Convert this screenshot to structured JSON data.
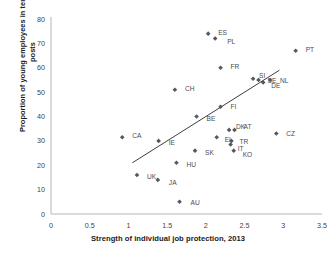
{
  "chart_data": {
    "type": "scatter",
    "title": "",
    "xlabel": "Strength of individual job protection, 2013",
    "ylabel": "Proportion of young employees in temporary posts",
    "xlim": [
      0,
      3.5
    ],
    "ylim": [
      0,
      80
    ],
    "xticks": [
      "0",
      "0.5",
      "1",
      "1.5",
      "2",
      "2.5",
      "3",
      "3.5"
    ],
    "yticks": [
      "0",
      "10",
      "20",
      "30",
      "40",
      "50",
      "60",
      "70",
      "80"
    ],
    "grid": false,
    "legend": "none",
    "marker_color": "#56565f",
    "trendline_color": "#3c3c44",
    "trendline": {
      "x0": 1.05,
      "y0": 21.0,
      "x1": 2.95,
      "y1": 59.0
    },
    "points": [
      {
        "label": "ES",
        "x": 2.03,
        "y": 74.0,
        "lx": 10,
        "ly": 1
      },
      {
        "label": "PL",
        "x": 2.12,
        "y": 72.0,
        "lx": 12,
        "ly": 5
      },
      {
        "label": "PT",
        "x": 3.16,
        "y": 67.0,
        "lx": 10,
        "ly": 1
      },
      {
        "label": "FR",
        "x": 2.19,
        "y": 60.0,
        "lx": 10,
        "ly": 1
      },
      {
        "label": "SI",
        "x": 2.61,
        "y": 55.5,
        "lx": 6,
        "ly": -1
      },
      {
        "label": "SE",
        "x": 2.68,
        "y": 55.0,
        "lx": 9,
        "ly": 0
      },
      {
        "label": "DE",
        "x": 2.74,
        "y": 54.0,
        "lx": 8,
        "ly": 6
      },
      {
        "label": "NL",
        "x": 2.83,
        "y": 55.0,
        "lx": 10,
        "ly": 0
      },
      {
        "label": "CH",
        "x": 1.6,
        "y": 51.0,
        "lx": 10,
        "ly": 1
      },
      {
        "label": "FI",
        "x": 2.19,
        "y": 44.0,
        "lx": 10,
        "ly": 2
      },
      {
        "label": "BE",
        "x": 1.88,
        "y": 40.0,
        "lx": 10,
        "ly": 4
      },
      {
        "label": "DK",
        "x": 2.3,
        "y": 34.5,
        "lx": 7,
        "ly": -1
      },
      {
        "label": "AT",
        "x": 2.37,
        "y": 34.5,
        "lx": 9,
        "ly": -1
      },
      {
        "label": "CZ",
        "x": 2.91,
        "y": 33.0,
        "lx": 10,
        "ly": 2
      },
      {
        "label": "CA",
        "x": 0.92,
        "y": 31.5,
        "lx": 10,
        "ly": 1
      },
      {
        "label": "EL",
        "x": 2.14,
        "y": 31.5,
        "lx": 8,
        "ly": 5
      },
      {
        "label": "IE",
        "x": 1.39,
        "y": 30.0,
        "lx": 10,
        "ly": 4
      },
      {
        "label": "TR",
        "x": 2.33,
        "y": 30.0,
        "lx": 8,
        "ly": 3
      },
      {
        "label": "IT",
        "x": 2.32,
        "y": 28.5,
        "lx": 7,
        "ly": 6
      },
      {
        "label": "KO",
        "x": 2.36,
        "y": 26.0,
        "lx": 9,
        "ly": 6
      },
      {
        "label": "SK",
        "x": 1.86,
        "y": 26.0,
        "lx": 10,
        "ly": 4
      },
      {
        "label": "HU",
        "x": 1.62,
        "y": 21.0,
        "lx": 10,
        "ly": 4
      },
      {
        "label": "UK",
        "x": 1.11,
        "y": 16.0,
        "lx": 10,
        "ly": 4
      },
      {
        "label": "JA",
        "x": 1.38,
        "y": 14.0,
        "lx": 11,
        "ly": 5
      },
      {
        "label": "AU",
        "x": 1.66,
        "y": 5.0,
        "lx": 11,
        "ly": 3
      }
    ]
  }
}
